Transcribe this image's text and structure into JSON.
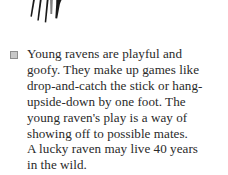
{
  "page": {
    "background_color": "#ffffff",
    "text_color": "#2a2a2a"
  },
  "illustration": {
    "name": "raven-talons-illustration",
    "description": "cropped black-ink drawing of a raven's foot with talons",
    "ink_color": "#1a1a1a"
  },
  "fact_block": {
    "bullet": {
      "shape": "square",
      "fill_color": "#c8c8c8",
      "border_color": "#8e8e8e"
    },
    "body": "Young ravens are playful and\ngoofy. They make up games like\ndrop-and-catch the stick or hang-\nupside-down by one foot. The\nyoung raven's play is a way of\nshowing off to possible mates.\nA lucky raven may live 40 years\nin the wild.",
    "lines": [
      "Young ravens are playful and",
      "goofy. They make up games like",
      "drop-and-catch the stick or hang-",
      "upside-down by one foot. The",
      "young raven's play is a way of",
      "showing off to possible mates.",
      "A lucky raven may live 40 years",
      "in the wild."
    ],
    "lifespan_years": 40
  }
}
